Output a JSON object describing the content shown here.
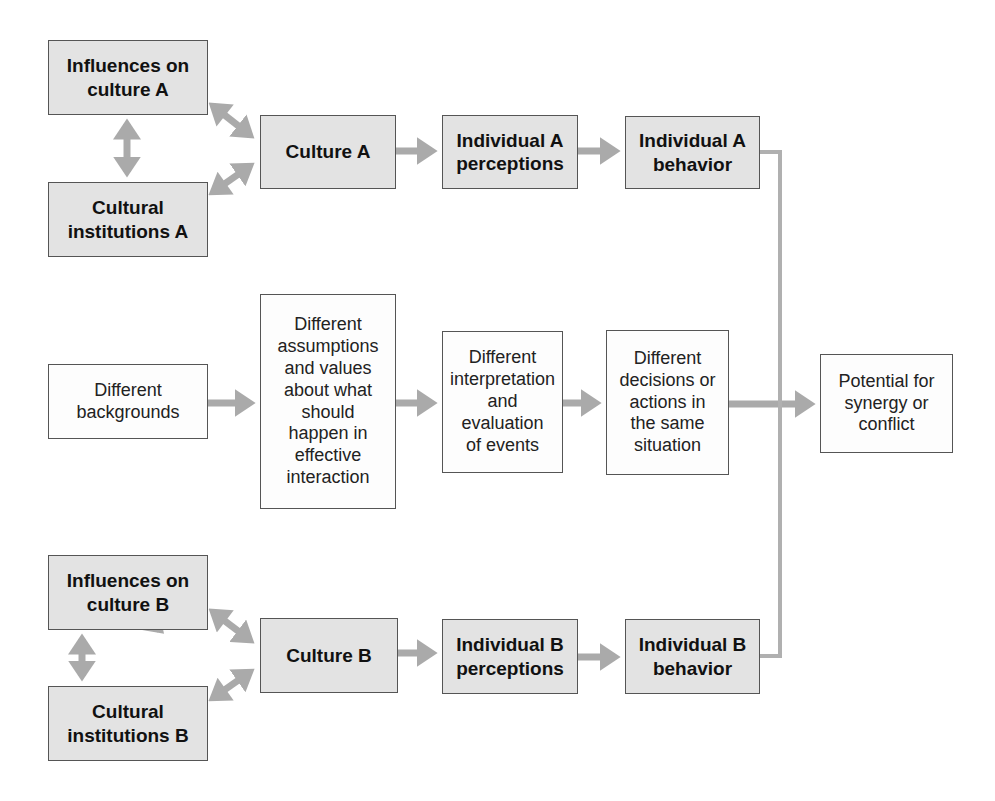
{
  "colors": {
    "shaded_fill": "#e3e3e3",
    "plain_fill": "#fdfdfd",
    "border": "#555555",
    "arrow": "#aaaaaa"
  },
  "row_a": {
    "influences": "Influences on\nculture A",
    "institutions": "Cultural\ninstitutions A",
    "culture": "Culture A",
    "perceptions": "Individual A\nperceptions",
    "behavior": "Individual A\nbehavior"
  },
  "row_mid": {
    "backgrounds": "Different\nbackgrounds",
    "assumptions": "Different\nassumptions\nand values\nabout what\nshould\nhappen in\neffective\ninteraction",
    "interpretation": "Different\ninterpretation\nand\nevaluation\nof events",
    "decisions": "Different\ndecisions or\nactions in\nthe same\nsituation",
    "outcome": "Potential for\nsynergy or\nconflict"
  },
  "row_b": {
    "influences": "Influences on\nculture B",
    "institutions": "Cultural\ninstitutions B",
    "culture": "Culture B",
    "perceptions": "Individual B\nperceptions",
    "behavior": "Individual B\nbehavior"
  }
}
